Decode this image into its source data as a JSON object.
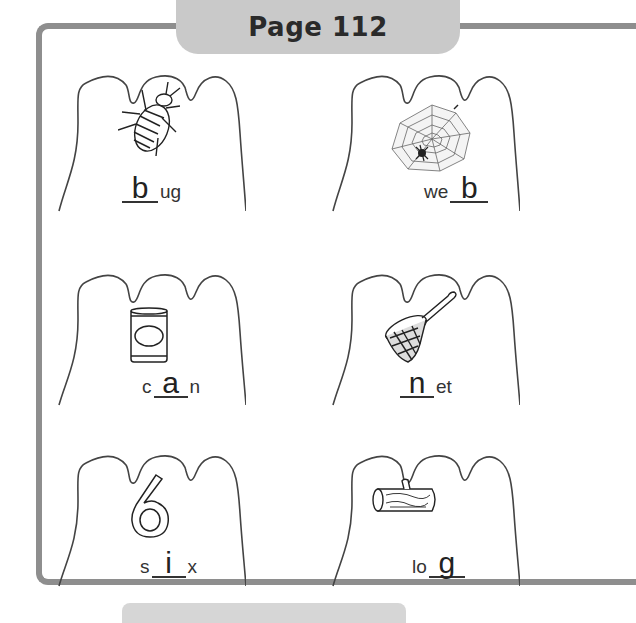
{
  "header": {
    "title": "Page 112"
  },
  "colors": {
    "frame_border": "#8e8e8e",
    "header_fill": "#c9c9c9",
    "ink": "#333333"
  },
  "items": [
    {
      "picture": "bug-icon",
      "before": "",
      "answer": "b",
      "after": "ug"
    },
    {
      "picture": "spider-web-icon",
      "before": "we",
      "answer": "b",
      "after": ""
    },
    {
      "picture": "can-icon",
      "before": "c",
      "answer": "a",
      "after": "n"
    },
    {
      "picture": "butterfly-net-icon",
      "before": "",
      "answer": "n",
      "after": "et"
    },
    {
      "picture": "number-six-icon",
      "before": "s",
      "answer": "i",
      "after": "x"
    },
    {
      "picture": "log-icon",
      "before": "lo",
      "answer": "g",
      "after": ""
    }
  ]
}
